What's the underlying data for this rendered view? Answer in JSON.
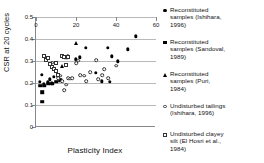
{
  "chart_data": {
    "type": "scatter",
    "title": "",
    "xlabel": "Plasticity Index",
    "ylabel": "CSR at 20 cycles",
    "xlim": [
      0,
      60
    ],
    "ylim": [
      0,
      0.5
    ],
    "xticks": [
      "0",
      "20",
      "40",
      "60"
    ],
    "xtick_values": [
      0,
      20,
      40,
      60
    ],
    "yticks": [
      "0",
      "0.1",
      "0.2",
      "0.3",
      "0.4",
      "0.5"
    ],
    "ytick_values": [
      0,
      0.1,
      0.2,
      0.3,
      0.4,
      0.5
    ],
    "grid": "horizontal",
    "legend_position": "right",
    "series": [
      {
        "name": "Reconstituted samples (Ishihara, 1996)",
        "marker": "filled-diamond",
        "color": "#000000",
        "points": [
          [
            2,
            0.205
          ],
          [
            3,
            0.237
          ],
          [
            4,
            0.197
          ],
          [
            6,
            0.205
          ],
          [
            7,
            0.217
          ],
          [
            8,
            0.198
          ],
          [
            9,
            0.229
          ],
          [
            14,
            0.318
          ],
          [
            15,
            0.318
          ],
          [
            16,
            0.322
          ],
          [
            20,
            0.307
          ],
          [
            22,
            0.316
          ],
          [
            25,
            0.36
          ],
          [
            30,
            0.247
          ],
          [
            33,
            0.208
          ],
          [
            36,
            0.36
          ],
          [
            37,
            0.205
          ],
          [
            38,
            0.322
          ],
          [
            41,
            0.298
          ],
          [
            46,
            0.353
          ],
          [
            50,
            0.413
          ]
        ]
      },
      {
        "name": "Reconstituted samples (Sandoval, 1989)",
        "marker": "filled-square",
        "color": "#000000",
        "points": [
          [
            2,
            0.188
          ],
          [
            3,
            0.157
          ],
          [
            3,
            0.115
          ],
          [
            4,
            0.188
          ],
          [
            6,
            0.196
          ],
          [
            8,
            0.196
          ],
          [
            10,
            0.206
          ],
          [
            12,
            0.212
          ],
          [
            15,
            0.315
          ]
        ]
      },
      {
        "name": "Reconstituted samples (Puri, 1984)",
        "marker": "filled-triangle",
        "color": "#000000",
        "points": [
          [
            9,
            0.262
          ],
          [
            13,
            0.277
          ],
          [
            20,
            0.383
          ]
        ]
      },
      {
        "name": "Undisturbed tailings (Ishihara, 1996)",
        "marker": "open-circle",
        "color": "#333333",
        "points": [
          [
            8,
            0.292
          ],
          [
            11,
            0.222
          ],
          [
            12,
            0.233
          ],
          [
            13,
            0.208
          ],
          [
            14,
            0.167
          ],
          [
            15,
            0.192
          ],
          [
            16,
            0.222
          ],
          [
            17,
            0.22
          ],
          [
            18,
            0.221
          ],
          [
            20,
            0.291
          ],
          [
            21,
            0.302
          ],
          [
            22,
            0.235
          ],
          [
            24,
            0.233
          ],
          [
            25,
            0.208
          ],
          [
            27,
            0.249
          ],
          [
            30,
            0.303
          ],
          [
            31,
            0.218
          ],
          [
            33,
            0.236
          ],
          [
            34,
            0.262
          ],
          [
            36,
            0.222
          ],
          [
            40,
            0.279
          ]
        ]
      },
      {
        "name": "Undisturbed clayey silt (El Hosri et al., 1984)",
        "marker": "open-square",
        "color": "#333333",
        "points": [
          [
            4,
            0.322
          ],
          [
            5,
            0.306
          ],
          [
            6,
            0.314
          ],
          [
            7,
            0.287
          ],
          [
            8,
            0.272
          ],
          [
            9,
            0.263
          ],
          [
            10,
            0.289
          ],
          [
            10,
            0.255
          ],
          [
            11,
            0.238
          ],
          [
            13,
            0.321
          ],
          [
            14,
            0.32
          ],
          [
            15,
            0.283
          ],
          [
            16,
            0.32
          ]
        ]
      }
    ],
    "legend": [
      {
        "marker": "filled-diamond",
        "label": "Reconstituted\nsamples (Ishihara,\n1996)"
      },
      {
        "marker": "filled-square",
        "label": "Reconstituted\nsamples (Sandoval,\n1989)"
      },
      {
        "marker": "filled-triangle",
        "label": "Reconstituted\nsamples (Puri,\n1984)"
      },
      {
        "marker": "open-circle",
        "label": "Undisturbed tailings\n(Ishihara, 1996)"
      },
      {
        "marker": "open-square",
        "label": "Undisturbed clayey\nsilt (El Hosri et al.,\n1984)"
      }
    ],
    "legend_row_tops": [
      3,
      35,
      67,
      99,
      127
    ]
  }
}
